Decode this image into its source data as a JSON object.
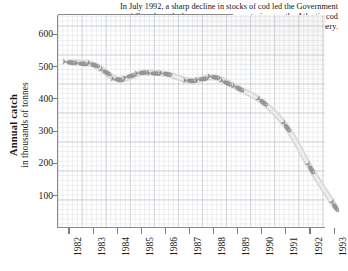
{
  "caption": {
    "text": "In July 1992, a sharp decline in stocks of cod led the Government of Canada to declare a two-year moratorium on the Atlantic cod fishery."
  },
  "axis": {
    "y_title_main": "Annual catch",
    "y_title_sub": "in thousands of tonnes"
  },
  "colors": {
    "ink": "#1a1a1a",
    "axis": "#8a8a8a",
    "grid_major": "#969ea8",
    "grid_minor": "#b0b8c2",
    "band": "#d9d9d9",
    "fish": "#8c8c8c",
    "background": "#ffffff"
  },
  "chart_data": {
    "type": "line",
    "title": "",
    "subtitle": "",
    "xlabel": "",
    "ylabel": "Annual catch in thousands of tonnes",
    "x": [
      1982,
      1983,
      1984,
      1985,
      1986,
      1987,
      1988,
      1989,
      1990,
      1991,
      1992,
      1993
    ],
    "categories": [
      "1982",
      "1983",
      "1984",
      "1985",
      "1986",
      "1987",
      "1988",
      "1989",
      "1990",
      "1991",
      "1992",
      "1993"
    ],
    "values": [
      513,
      505,
      460,
      481,
      477,
      456,
      467,
      432,
      390,
      312,
      183,
      66
    ],
    "series": [
      {
        "name": "Annual cod catch",
        "values": [
          513,
          505,
          460,
          481,
          477,
          456,
          467,
          432,
          390,
          312,
          183,
          66
        ]
      }
    ],
    "xlim": [
      1982,
      1993
    ],
    "ylim": [
      0,
      660
    ],
    "yticks": [
      100,
      200,
      300,
      400,
      500,
      600
    ],
    "ytick_labels": [
      "100",
      "200",
      "300",
      "400",
      "500",
      "600"
    ],
    "xticks": [
      1982,
      1983,
      1984,
      1985,
      1986,
      1987,
      1988,
      1989,
      1990,
      1991,
      1992,
      1993
    ],
    "grid": true,
    "legend": false,
    "legend_position": "none",
    "marker": "fish-icon",
    "annotations": [
      "In July 1992, a sharp decline in stocks of cod led the Government of Canada to declare a two-year moratorium on the Atlantic cod fishery."
    ]
  }
}
